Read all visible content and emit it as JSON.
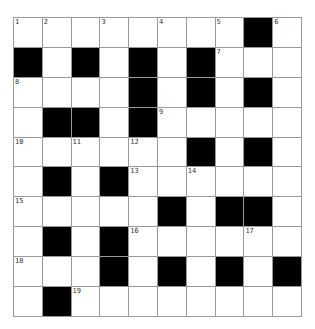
{
  "puzzle": {
    "rows": 10,
    "cols": 10,
    "colors": {
      "black": "#000000",
      "white": "#ffffff",
      "gridline": "#9a9a9a",
      "number": "#333333"
    },
    "layout": [
      "........#.",
      "#.#.#.#...",
      "....#.#.#.",
      ".##.#.....",
      "......#.#.",
      ".#.#......",
      ".....#.##.",
      ".#.#......",
      "...#.#.#.#",
      ".#........"
    ],
    "numbers": [
      {
        "n": "1",
        "r": 0,
        "c": 0
      },
      {
        "n": "2",
        "r": 0,
        "c": 1
      },
      {
        "n": "3",
        "r": 0,
        "c": 3
      },
      {
        "n": "4",
        "r": 0,
        "c": 5
      },
      {
        "n": "5",
        "r": 0,
        "c": 7
      },
      {
        "n": "6",
        "r": 0,
        "c": 9
      },
      {
        "n": "7",
        "r": 1,
        "c": 7
      },
      {
        "n": "8",
        "r": 2,
        "c": 0
      },
      {
        "n": "9",
        "r": 3,
        "c": 5
      },
      {
        "n": "10",
        "r": 4,
        "c": 0
      },
      {
        "n": "11",
        "r": 4,
        "c": 2
      },
      {
        "n": "12",
        "r": 4,
        "c": 4
      },
      {
        "n": "13",
        "r": 5,
        "c": 4
      },
      {
        "n": "14",
        "r": 5,
        "c": 6
      },
      {
        "n": "15",
        "r": 6,
        "c": 0
      },
      {
        "n": "16",
        "r": 7,
        "c": 4
      },
      {
        "n": "17",
        "r": 7,
        "c": 8
      },
      {
        "n": "18",
        "r": 8,
        "c": 0
      },
      {
        "n": "19",
        "r": 9,
        "c": 2
      }
    ]
  }
}
